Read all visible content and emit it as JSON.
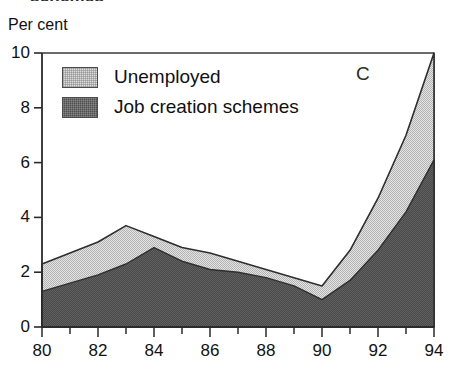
{
  "figure": {
    "clipped_caption_fragment": "schemes",
    "panel_letter": "C",
    "y_axis_unit": "Per cent"
  },
  "legend": {
    "position": "inside-top-left",
    "items": [
      {
        "label": "Unemployed",
        "swatch": "light-gray-swatch",
        "color": "#dedede"
      },
      {
        "label": "Job creation schemes",
        "swatch": "dark-gray-swatch",
        "color": "#4f4f4f"
      }
    ]
  },
  "chart_data": {
    "type": "area",
    "stacked": true,
    "title": "",
    "subtitle": "",
    "xlabel": "",
    "ylabel": "Per cent",
    "xlim": [
      80,
      94
    ],
    "ylim": [
      0,
      10
    ],
    "grid": false,
    "legend_position": "inside-top-left",
    "annotations": [
      {
        "text": "C",
        "x": 92,
        "y": 9.2
      }
    ],
    "x": [
      80,
      81,
      82,
      83,
      84,
      85,
      86,
      87,
      88,
      89,
      90,
      91,
      92,
      93,
      94
    ],
    "xticks": [
      80,
      82,
      84,
      86,
      88,
      90,
      92,
      94
    ],
    "xticklabels": [
      "80",
      "82",
      "84",
      "86",
      "88",
      "90",
      "92",
      "94"
    ],
    "xminorticks": [
      81,
      83,
      85,
      87,
      89,
      91,
      93
    ],
    "yticks": [
      0,
      2,
      4,
      6,
      8,
      10
    ],
    "yticklabels": [
      "0",
      "2",
      "4",
      "6",
      "8",
      "10"
    ],
    "series": [
      {
        "name": "Job creation schemes",
        "color": "#4f4f4f",
        "values": [
          1.3,
          1.6,
          1.9,
          2.3,
          2.9,
          2.4,
          2.1,
          2.0,
          1.8,
          1.5,
          1.0,
          1.7,
          2.8,
          4.2,
          6.1
        ]
      },
      {
        "name": "Unemployed",
        "color": "#dedede",
        "note": "increment above job creation schemes; stacked total shown below",
        "values": [
          1.0,
          1.1,
          1.2,
          1.4,
          0.4,
          0.5,
          0.6,
          0.4,
          0.3,
          0.3,
          0.5,
          1.1,
          1.9,
          2.8,
          3.9
        ]
      }
    ],
    "totals": {
      "name": "Total (stacked top edge)",
      "values": [
        2.3,
        2.7,
        3.1,
        3.7,
        3.3,
        2.9,
        2.7,
        2.4,
        2.1,
        1.8,
        1.5,
        2.8,
        4.7,
        7.0,
        10.0
      ]
    }
  }
}
